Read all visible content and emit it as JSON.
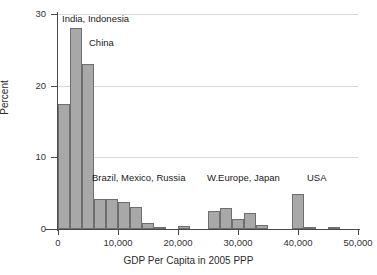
{
  "chart_data": {
    "type": "bar",
    "title": "",
    "subtitle": "",
    "xlabel": "GDP Per Capita in 2005 PPP",
    "ylabel": "Percent",
    "xlim": [
      0,
      50000
    ],
    "ylim": [
      0,
      30
    ],
    "grid": true,
    "legend": "none",
    "bin_width": 2000,
    "x_ticks": [
      {
        "value": 0,
        "label": "0"
      },
      {
        "value": 10000,
        "label": "10,000"
      },
      {
        "value": 20000,
        "label": "20,000"
      },
      {
        "value": 30000,
        "label": "30,000"
      },
      {
        "value": 40000,
        "label": "40,000"
      },
      {
        "value": 50000,
        "label": "50,000"
      }
    ],
    "y_ticks": [
      {
        "value": 0,
        "label": "0"
      },
      {
        "value": 10,
        "label": "10"
      },
      {
        "value": 20,
        "label": "20"
      },
      {
        "value": 30,
        "label": "30"
      }
    ],
    "bars": [
      {
        "x0": 0,
        "x1": 2000,
        "value": 17.5
      },
      {
        "x0": 2000,
        "x1": 4000,
        "value": 28.0
      },
      {
        "x0": 4000,
        "x1": 6000,
        "value": 23.0
      },
      {
        "x0": 6000,
        "x1": 8000,
        "value": 4.2
      },
      {
        "x0": 8000,
        "x1": 10000,
        "value": 4.2
      },
      {
        "x0": 10000,
        "x1": 12000,
        "value": 3.7
      },
      {
        "x0": 12000,
        "x1": 14000,
        "value": 3.1
      },
      {
        "x0": 14000,
        "x1": 16000,
        "value": 0.8
      },
      {
        "x0": 16000,
        "x1": 18000,
        "value": 0.1
      },
      {
        "x0": 20000,
        "x1": 22000,
        "value": 0.4
      },
      {
        "x0": 25000,
        "x1": 27000,
        "value": 2.5
      },
      {
        "x0": 27000,
        "x1": 29000,
        "value": 2.9
      },
      {
        "x0": 29000,
        "x1": 31000,
        "value": 1.4
      },
      {
        "x0": 31000,
        "x1": 33000,
        "value": 2.3
      },
      {
        "x0": 33000,
        "x1": 35000,
        "value": 0.5
      },
      {
        "x0": 39000,
        "x1": 41000,
        "value": 4.9
      },
      {
        "x0": 41000,
        "x1": 43000,
        "value": 0.15
      },
      {
        "x0": 45000,
        "x1": 47000,
        "value": 0.2
      }
    ],
    "annotations": [
      {
        "text": "India, Indonesia",
        "x": 62,
        "y": 14
      },
      {
        "text": "China",
        "x": 89,
        "y": 38
      },
      {
        "text": "Brazil, Mexico, Russia",
        "x": 92,
        "y": 173
      },
      {
        "text": "W.Europe, Japan",
        "x": 207,
        "y": 173
      },
      {
        "text": "USA",
        "x": 307,
        "y": 173
      }
    ],
    "colors": {
      "bar_fill": "#a8a8a8",
      "bar_edge": "#6e6e6e",
      "grid": "#d9d9d9",
      "axis": "#4a4a4a",
      "text": "#2b2b2b",
      "background": "#ffffff"
    }
  }
}
